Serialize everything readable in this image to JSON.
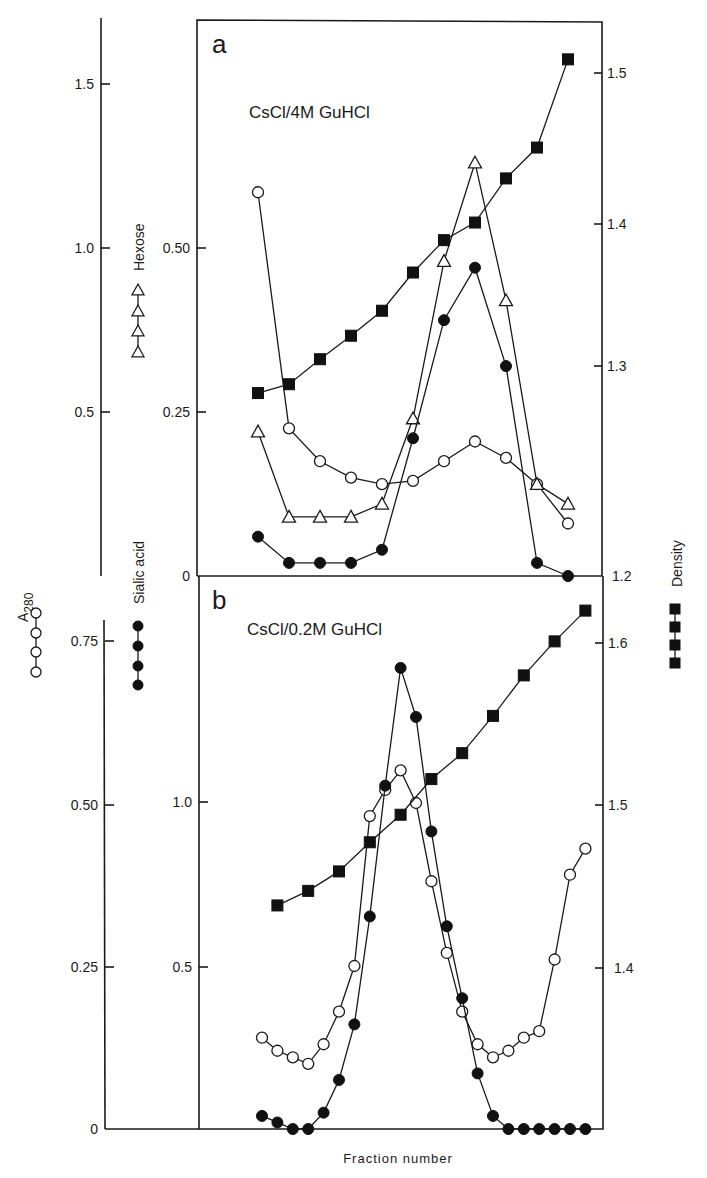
{
  "figure": {
    "x_axis_label": "Fraction number",
    "legend": {
      "a280": "A",
      "a280_sub": "280",
      "sialic": "Sialic acid",
      "hexose": "Hexose",
      "density": "Density"
    },
    "colors": {
      "ink": "#1a1a1a",
      "background": "#ffffff"
    }
  },
  "panels": {
    "a": {
      "letter": "a",
      "condition": "CsCl/4M GuHCl",
      "left_outer_ticks": [
        "1.5",
        "1.0",
        "0.5"
      ],
      "left_inner_ticks": [
        "0.50",
        "0.25",
        "0"
      ],
      "right_ticks": [
        "1.5",
        "1.4",
        "1.3",
        "1.2"
      ]
    },
    "b": {
      "letter": "b",
      "condition": "CsCl/0.2M GuHCl",
      "left_outer_ticks": [
        "0.75",
        "0.50",
        "0.25",
        "0"
      ],
      "left_inner_ticks": [
        "1.0",
        "0.5"
      ],
      "right_ticks": [
        "1.6",
        "1.5",
        "1.4"
      ]
    }
  },
  "chart_data": [
    {
      "type": "line",
      "title": "a  CsCl/4M GuHCl",
      "xlabel": "Fraction number",
      "x": [
        1,
        2,
        3,
        4,
        5,
        6,
        7,
        8,
        9,
        10,
        11
      ],
      "series": [
        {
          "name": "A280",
          "marker": "open-circle",
          "axis": "left-outer",
          "values": [
            1.17,
            0.45,
            0.35,
            0.3,
            0.28,
            0.29,
            0.35,
            0.41,
            0.36,
            0.28,
            0.16
          ]
        },
        {
          "name": "Hexose",
          "marker": "open-triangle",
          "axis": "left-inner",
          "values": [
            0.22,
            0.09,
            0.09,
            0.09,
            0.11,
            0.24,
            0.48,
            0.63,
            0.42,
            0.14,
            0.11
          ]
        },
        {
          "name": "Sialic acid",
          "marker": "filled-circle",
          "axis": "left-inner",
          "values": [
            0.06,
            0.02,
            0.02,
            0.02,
            0.04,
            0.21,
            0.39,
            0.47,
            0.32,
            0.02,
            0.0
          ]
        },
        {
          "name": "Density",
          "marker": "filled-square",
          "axis": "right",
          "values": [
            1.285,
            1.291,
            1.308,
            1.324,
            1.341,
            1.367,
            1.389,
            1.401,
            1.431,
            1.452,
            1.512
          ]
        }
      ],
      "axes": {
        "left_outer": {
          "label": "A280",
          "ticks": [
            0.5,
            1.0,
            1.5
          ],
          "range": [
            0,
            1.75
          ]
        },
        "left_inner": {
          "label": "Hexose / Sialic acid",
          "ticks": [
            0,
            0.25,
            0.5
          ],
          "range": [
            0,
            0.68
          ]
        },
        "right": {
          "label": "Density",
          "ticks": [
            1.2,
            1.3,
            1.4,
            1.5
          ],
          "range": [
            1.2,
            1.55
          ]
        }
      }
    },
    {
      "type": "line",
      "title": "b  CsCl/0.2M GuHCl",
      "xlabel": "Fraction number",
      "x": [
        1,
        2,
        3,
        4,
        5,
        6,
        7,
        8,
        9,
        10,
        11,
        12,
        13,
        14,
        15,
        16,
        17,
        18,
        19,
        20,
        21,
        22
      ],
      "series": [
        {
          "name": "A280",
          "marker": "open-circle",
          "axis": "left-outer",
          "values": [
            0.14,
            0.12,
            0.11,
            0.1,
            0.13,
            0.18,
            0.25,
            0.48,
            0.52,
            0.55,
            0.5,
            0.38,
            0.27,
            0.18,
            0.13,
            0.11,
            0.12,
            0.14,
            0.15,
            0.26,
            0.39,
            0.43
          ]
        },
        {
          "name": "Sialic acid",
          "marker": "filled-circle",
          "axis": "left-inner",
          "values": [
            0.04,
            0.02,
            0.0,
            0.0,
            0.05,
            0.15,
            0.32,
            0.65,
            1.05,
            1.41,
            1.26,
            0.91,
            0.62,
            0.4,
            0.17,
            0.04,
            0.0,
            0.0,
            0.0,
            0.0,
            0.0,
            0.0
          ]
        },
        {
          "name": "Density",
          "marker": "filled-square",
          "axis": "right",
          "x": [
            2,
            4,
            6,
            8,
            10,
            12,
            14,
            16,
            18,
            20,
            22
          ],
          "values": [
            1.438,
            1.447,
            1.459,
            1.477,
            1.494,
            1.516,
            1.532,
            1.555,
            1.58,
            1.601,
            1.62
          ]
        }
      ],
      "axes": {
        "left_outer": {
          "label": "A280",
          "ticks": [
            0,
            0.25,
            0.5,
            0.75
          ],
          "range": [
            0,
            0.85
          ]
        },
        "left_inner": {
          "label": "Sialic acid",
          "ticks": [
            0,
            0.5,
            1.0
          ],
          "range": [
            0,
            1.7
          ]
        },
        "right": {
          "label": "Density",
          "ticks": [
            1.4,
            1.5,
            1.6
          ],
          "range": [
            1.3,
            1.63
          ]
        }
      }
    }
  ]
}
